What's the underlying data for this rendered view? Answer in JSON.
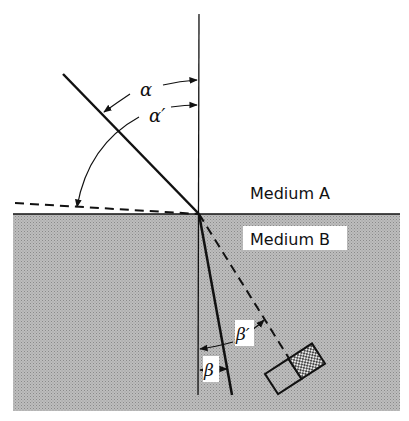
{
  "diagram": {
    "type": "refraction",
    "colors": {
      "background": "#ffffff",
      "medium_b_fill": "#b4b4b4",
      "line": "#111111",
      "label_box": "#ffffff"
    },
    "labels": {
      "medium_a": "Medium A",
      "medium_b": "Medium B",
      "alpha": "α",
      "alpha_prime": "α′",
      "beta": "β",
      "beta_prime": "β′"
    },
    "elements": [
      {
        "id": "normal",
        "kind": "line",
        "style": "solid"
      },
      {
        "id": "incident-ray",
        "kind": "line",
        "style": "solid",
        "note": "angle α to normal"
      },
      {
        "id": "grazing-ray",
        "kind": "line",
        "style": "dashed",
        "note": "angle α′ to normal"
      },
      {
        "id": "interface",
        "kind": "line",
        "style": "solid"
      },
      {
        "id": "refracted-ray",
        "kind": "line",
        "style": "solid",
        "note": "angle β to normal"
      },
      {
        "id": "critical-ray",
        "kind": "line",
        "style": "dashed",
        "note": "angle β′ to normal"
      },
      {
        "id": "detector",
        "kind": "rectangle-pair",
        "note": "one half hatched"
      }
    ]
  }
}
